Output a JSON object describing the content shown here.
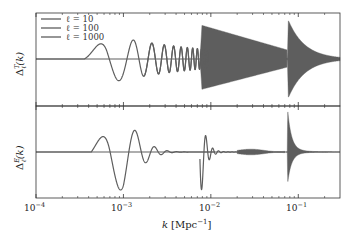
{
  "chart_data": {
    "type": "line",
    "title": "",
    "xlabel": "k [Mpc^-1]",
    "xscale": "log",
    "xlim": [
      0.0001,
      0.3
    ],
    "xticks": [
      {
        "value": 0.0001,
        "label": "10^-4"
      },
      {
        "value": 0.001,
        "label": "10^-3"
      },
      {
        "value": 0.01,
        "label": "10^-2"
      },
      {
        "value": 0.1,
        "label": "10^-1"
      }
    ],
    "legend": {
      "position": "upper left",
      "entries": [
        "ℓ = 10",
        "ℓ = 100",
        "ℓ = 1000"
      ]
    },
    "panels": [
      {
        "name": "temperature",
        "ylabel": "Δ_ℓ^T(k)",
        "grid": false,
        "series": [
          {
            "name": "ℓ = 10",
            "description": "single dip near k≈9e-4 then oscillations decaying to k≈1e-2",
            "k_onset": 0.0005,
            "k_peak": 0.0009
          },
          {
            "name": "ℓ = 100",
            "description": "dense oscillations starting ~1e-2, envelope decaying to ~0.07",
            "k_onset": 0.008
          },
          {
            "name": "ℓ = 1000",
            "description": "sharp envelope onset at k≈0.075, decaying toward 0.3",
            "k_onset": 0.075
          }
        ]
      },
      {
        "name": "polarization",
        "ylabel": "Δ_ℓ^E(k)",
        "grid": false,
        "series": [
          {
            "name": "ℓ = 10",
            "description": "dip near k≈9e-4, positive peak near 1.3e-3, damped oscillations",
            "k_onset": 0.0005
          },
          {
            "name": "ℓ = 100",
            "description": "negative spike at k≈8e-3 followed by fast decaying oscillations",
            "k_onset": 0.008
          },
          {
            "name": "ℓ = 1000",
            "description": "sharp spike at k≈0.075 with rapid decay",
            "k_onset": 0.075
          }
        ]
      }
    ]
  },
  "labels": {
    "xlabel_k": "k",
    "xlabel_unit": "[Mpc",
    "xlabel_exp": "−1",
    "xlabel_close": "]",
    "ylabel_top_base": "Δ",
    "ylabel_top_sup": "T",
    "ylabel_top_sub": "ℓ",
    "ylabel_top_arg": "(k)",
    "ylabel_bot_base": "Δ",
    "ylabel_bot_sup": "E",
    "ylabel_bot_sub": "ℓ",
    "ylabel_bot_arg": "(k)",
    "tick_base": "10",
    "tick_exps": [
      "−4",
      "−3",
      "−2",
      "−1"
    ],
    "legend": [
      "ℓ = 10",
      "ℓ = 100",
      "ℓ = 1000"
    ]
  },
  "colors": {
    "curve": "#5e5e5e",
    "axes": "#333333",
    "zero_line": "#6a6a6a"
  }
}
